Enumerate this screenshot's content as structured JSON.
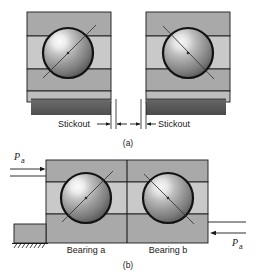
{
  "figure": {
    "background_color": "#ffffff",
    "line_color": "#1a1a1a"
  },
  "palette": {
    "block_gray": "#a9a9a9",
    "band_light": "#c9c9c9",
    "band_mid": "#b4b4b4",
    "shelf_light": "#bdbdbd",
    "dark_band": "#5a5a5a",
    "ball_highlight": "#f2f2f2",
    "ball_mid": "#9a9a9a",
    "ball_dark": "#4a4a4a",
    "outline": "#1a1a1a"
  },
  "panel_a": {
    "caption": "(a)",
    "bearings": [
      {
        "id": "left-bearing",
        "contact_line_direction": "up-right"
      },
      {
        "id": "right-bearing",
        "contact_line_direction": "up-left"
      }
    ],
    "dimension_left": {
      "label": "Stickout",
      "arrow": "right"
    },
    "dimension_right": {
      "label": "Stickout",
      "arrow": "left"
    }
  },
  "panel_b": {
    "caption": "(b)",
    "bearing_labels": [
      {
        "id": "bearing-a-label",
        "text": "Bearing a"
      },
      {
        "id": "bearing-b-label",
        "text": "Bearing b"
      }
    ],
    "force_left": {
      "symbol": "P",
      "subscript": "a",
      "arrow": "right"
    },
    "force_right": {
      "symbol": "P",
      "subscript": "a",
      "arrow": "left"
    },
    "support": {
      "id": "ground-support",
      "hatching": true
    }
  }
}
